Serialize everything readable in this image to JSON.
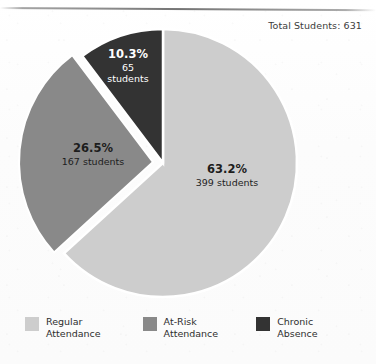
{
  "chart_data": {
    "type": "pie",
    "title": "Total Students: 631",
    "total_label_prefix": "Total Students:",
    "total": 631,
    "categories": [
      "Regular Attendance",
      "At-Risk Attendance",
      "Chronic Absence"
    ],
    "values": [
      399,
      167,
      65
    ],
    "percentages": [
      63.2,
      26.5,
      10.3
    ],
    "colors": [
      "#cdcdcd",
      "#898989",
      "#333333"
    ],
    "legend_position": "bottom",
    "grid": false,
    "xlabel": "",
    "ylabel": "",
    "slices": [
      {
        "name": "Regular Attendance",
        "percent_label": "63.2%",
        "count_label": "399 students",
        "value": 399,
        "percent": 63.2,
        "color": "#cdcdcd",
        "label_color": "#1d1d1d",
        "exploded": false
      },
      {
        "name": "At-Risk Attendance",
        "percent_label": "26.5%",
        "count_label": "167 students",
        "value": 167,
        "percent": 26.5,
        "color": "#898989",
        "label_color": "#1d1d1d",
        "exploded": true
      },
      {
        "name": "Chronic Absence",
        "percent_label": "10.3%",
        "count_label_line1": "65",
        "count_label_line2": "students",
        "count_label": "65 students",
        "value": 65,
        "percent": 10.3,
        "color": "#333333",
        "label_color": "#ffffff",
        "exploded": false
      }
    ]
  },
  "legend": {
    "items": [
      {
        "label_line1": "Regular",
        "label_line2": "Attendance",
        "color": "#cdcdcd"
      },
      {
        "label_line1": "At-Risk",
        "label_line2": "Attendance",
        "color": "#898989"
      },
      {
        "label_line1": "Chronic",
        "label_line2": "Absence",
        "color": "#333333"
      }
    ]
  },
  "page": {
    "background": "#fdfdfd"
  }
}
